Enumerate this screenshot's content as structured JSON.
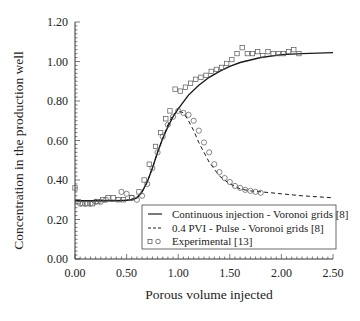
{
  "chart_data": {
    "type": "line",
    "title": "",
    "xlabel": "Porous volume injected",
    "ylabel": "Concentration in the production well",
    "xlim": [
      0,
      2.5
    ],
    "ylim": [
      0,
      1.2
    ],
    "xticks": [
      "0.00",
      "0.50",
      "1.00",
      "1.50",
      "2.00",
      "2.50"
    ],
    "xtick_values": [
      0,
      0.5,
      1.0,
      1.5,
      2.0,
      2.5
    ],
    "yticks": [
      "0.00",
      "0.20",
      "0.40",
      "0.60",
      "0.80",
      "1.00",
      "1.20"
    ],
    "ytick_values": [
      0,
      0.2,
      0.4,
      0.6,
      0.8,
      1.0,
      1.2
    ],
    "grid": false,
    "legend_position": "bottom-right",
    "legend": [
      {
        "label": "Continuous injection - Voronoi grids [8]",
        "style": "solid"
      },
      {
        "label": "0.4 PVI - Pulse - Voronoi grids [8]",
        "style": "dashed"
      },
      {
        "label": "Experimental [13]",
        "style": "markers"
      }
    ],
    "series": [
      {
        "name": "Continuous injection - Voronoi grids [8]",
        "style": "solid",
        "x": [
          0.0,
          0.1,
          0.2,
          0.3,
          0.4,
          0.5,
          0.55,
          0.6,
          0.65,
          0.7,
          0.75,
          0.8,
          0.85,
          0.9,
          0.95,
          1.0,
          1.1,
          1.2,
          1.3,
          1.4,
          1.5,
          1.6,
          1.8,
          2.0,
          2.2,
          2.5
        ],
        "y": [
          0.295,
          0.295,
          0.295,
          0.295,
          0.295,
          0.297,
          0.3,
          0.31,
          0.34,
          0.39,
          0.46,
          0.54,
          0.61,
          0.67,
          0.72,
          0.76,
          0.83,
          0.88,
          0.92,
          0.95,
          0.975,
          0.995,
          1.02,
          1.035,
          1.04,
          1.045
        ]
      },
      {
        "name": "0.4 PVI - Pulse - Voronoi grids [8]",
        "style": "dashed",
        "x": [
          0.0,
          0.2,
          0.4,
          0.5,
          0.6,
          0.65,
          0.7,
          0.75,
          0.8,
          0.85,
          0.9,
          0.95,
          1.0,
          1.05,
          1.1,
          1.15,
          1.2,
          1.3,
          1.4,
          1.5,
          1.6,
          1.7,
          1.8,
          2.0,
          2.2,
          2.5
        ],
        "y": [
          0.295,
          0.295,
          0.295,
          0.297,
          0.31,
          0.34,
          0.39,
          0.46,
          0.54,
          0.61,
          0.68,
          0.73,
          0.75,
          0.74,
          0.7,
          0.65,
          0.59,
          0.49,
          0.42,
          0.38,
          0.355,
          0.345,
          0.34,
          0.33,
          0.32,
          0.31
        ]
      },
      {
        "name": "Experimental [13] (squares)",
        "style": "square-markers",
        "x": [
          0.0,
          0.03,
          0.07,
          0.12,
          0.17,
          0.22,
          0.27,
          0.32,
          0.37,
          0.42,
          0.47,
          0.55,
          0.62,
          0.67,
          0.72,
          0.78,
          0.83,
          0.88,
          0.92,
          0.97,
          1.02,
          1.07,
          1.12,
          1.17,
          1.22,
          1.27,
          1.32,
          1.37,
          1.42,
          1.47,
          1.52,
          1.57,
          1.62,
          1.67,
          1.72,
          1.77,
          1.82,
          1.87,
          1.92,
          1.97,
          2.02,
          2.07,
          2.12,
          2.17
        ],
        "y": [
          0.36,
          0.29,
          0.28,
          0.28,
          0.28,
          0.29,
          0.3,
          0.31,
          0.31,
          0.3,
          0.3,
          0.31,
          0.34,
          0.4,
          0.48,
          0.57,
          0.64,
          0.71,
          0.75,
          0.86,
          0.85,
          0.87,
          0.89,
          0.91,
          0.92,
          0.93,
          0.95,
          0.96,
          0.97,
          0.99,
          1.01,
          1.04,
          1.07,
          1.04,
          1.04,
          1.05,
          1.03,
          1.05,
          1.04,
          1.04,
          1.04,
          1.05,
          1.06,
          1.04
        ]
      },
      {
        "name": "Experimental [13] (circles)",
        "style": "circle-markers",
        "x": [
          0.05,
          0.1,
          0.15,
          0.2,
          0.25,
          0.3,
          0.45,
          0.5,
          0.55,
          0.6,
          0.65,
          0.7,
          0.75,
          0.8,
          0.85,
          0.9,
          0.95,
          1.0,
          1.05,
          1.1,
          1.15,
          1.2,
          1.25,
          1.3,
          1.35,
          1.4,
          1.45,
          1.5,
          1.55,
          1.6,
          1.65,
          1.7,
          1.75,
          1.8
        ],
        "y": [
          0.28,
          0.28,
          0.28,
          0.29,
          0.29,
          0.3,
          0.34,
          0.33,
          0.31,
          0.3,
          0.32,
          0.38,
          0.46,
          0.54,
          0.62,
          0.68,
          0.72,
          0.75,
          0.74,
          0.73,
          0.7,
          0.65,
          0.59,
          0.54,
          0.48,
          0.44,
          0.41,
          0.39,
          0.37,
          0.36,
          0.35,
          0.345,
          0.34,
          0.335
        ]
      }
    ]
  }
}
